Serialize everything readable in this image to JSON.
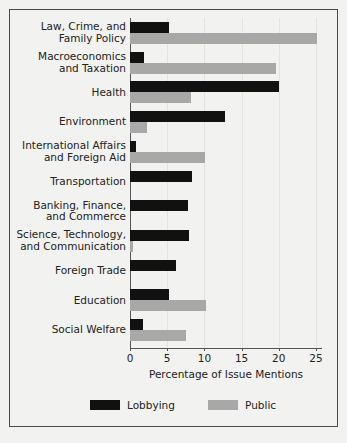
{
  "chart_data": {
    "type": "bar",
    "orientation": "horizontal",
    "title": "",
    "xlabel": "Percentage of Issue Mentions",
    "ylabel": "",
    "xlim": [
      0,
      26
    ],
    "xticks": [
      0,
      5,
      10,
      15,
      20,
      25
    ],
    "xtick_labels": [
      "0",
      "5",
      "10",
      "15",
      "20",
      "25"
    ],
    "grid": true,
    "grid_axis": "x",
    "legend_position": "bottom",
    "categories": [
      "Law, Crime, and\nFamily Policy",
      "Macroeconomics\nand Taxation",
      "Health",
      "Environment",
      "International Affairs\nand Foreign Aid",
      "Transportation",
      "Banking, Finance,\nand Commerce",
      "Science, Technology,\nand Communication",
      "Foreign Trade",
      "Education",
      "Social Welfare"
    ],
    "series": [
      {
        "name": "Lobbying",
        "color": "#111111",
        "values": [
          5.2,
          1.9,
          20.0,
          12.8,
          0.8,
          8.3,
          7.8,
          7.9,
          6.2,
          5.2,
          1.7
        ]
      },
      {
        "name": "Public",
        "color": "#a8a8a8",
        "values": [
          25.1,
          19.6,
          8.2,
          2.3,
          10.1,
          0.0,
          0.0,
          0.4,
          0.0,
          10.2,
          7.5
        ]
      }
    ]
  },
  "legend": {
    "entries": [
      {
        "label": "Lobbying",
        "color": "#111111"
      },
      {
        "label": "Public",
        "color": "#a8a8a8"
      }
    ]
  },
  "axis": {
    "x_title": "Percentage of Issue Mentions"
  }
}
